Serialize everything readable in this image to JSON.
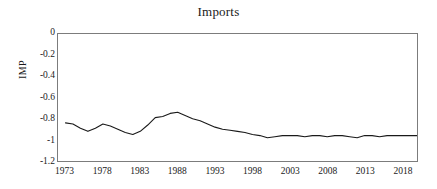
{
  "chart_data": {
    "type": "line",
    "title": "Imports",
    "xlabel": "",
    "ylabel": "IMP",
    "legend": null,
    "grid": false,
    "xlim": [
      1972,
      2020
    ],
    "ylim": [
      -1.2,
      0
    ],
    "yticks": [
      0,
      -0.2,
      -0.4,
      -0.6,
      -0.8,
      -1,
      -1.2
    ],
    "ytick_labels": [
      "0",
      "-0.2",
      "-0.4",
      "-0.6",
      "-0.8",
      "-1",
      "-1.2"
    ],
    "xticks": [
      1973,
      1978,
      1983,
      1988,
      1993,
      1998,
      2003,
      2008,
      2013,
      2018
    ],
    "xtick_labels": [
      "1973",
      "1978",
      "1983",
      "1988",
      "1993",
      "1998",
      "2003",
      "2008",
      "2013",
      "2018"
    ],
    "series": [
      {
        "name": "IMP",
        "color": "#1a1a1a",
        "x": [
          1973,
          1974,
          1975,
          1976,
          1977,
          1978,
          1979,
          1980,
          1981,
          1982,
          1983,
          1984,
          1985,
          1986,
          1987,
          1988,
          1989,
          1990,
          1991,
          1992,
          1993,
          1994,
          1995,
          1996,
          1997,
          1998,
          1999,
          2000,
          2001,
          2002,
          2003,
          2004,
          2005,
          2006,
          2007,
          2008,
          2009,
          2010,
          2011,
          2012,
          2013,
          2014,
          2015,
          2016,
          2017,
          2018,
          2019,
          2020
        ],
        "values": [
          -0.84,
          -0.85,
          -0.89,
          -0.92,
          -0.89,
          -0.85,
          -0.87,
          -0.9,
          -0.93,
          -0.95,
          -0.92,
          -0.86,
          -0.79,
          -0.78,
          -0.75,
          -0.74,
          -0.77,
          -0.8,
          -0.82,
          -0.85,
          -0.88,
          -0.9,
          -0.91,
          -0.92,
          -0.93,
          -0.95,
          -0.96,
          -0.98,
          -0.97,
          -0.96,
          -0.96,
          -0.96,
          -0.97,
          -0.96,
          -0.96,
          -0.97,
          -0.96,
          -0.96,
          -0.97,
          -0.98,
          -0.96,
          -0.96,
          -0.97,
          -0.96,
          -0.96,
          -0.96,
          -0.96,
          -0.96
        ]
      }
    ]
  },
  "axis": {
    "y_label": "IMP",
    "frame_color": "#7c7c7c"
  }
}
